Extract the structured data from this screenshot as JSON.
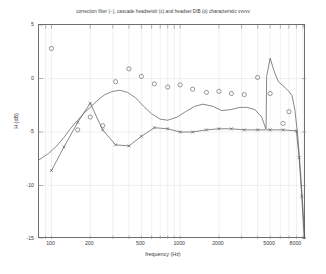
{
  "chart_data": {
    "type": "line",
    "title": "correction filter (−), cascade headsetslr (x) and headset DIB (o) characteristic  vvvvv",
    "xlabel": "frequency (Hz)",
    "ylabel": "H (dB)",
    "xscale": "log",
    "xlim": [
      80,
      9500
    ],
    "ylim": [
      -15,
      5
    ],
    "yticks": [
      5,
      0,
      -5,
      -10,
      -15
    ],
    "xticks": [
      100,
      200,
      500,
      1000,
      2000,
      5000,
      8000
    ],
    "xtick_labels": [
      "100",
      "200",
      "500",
      "1000",
      "2000",
      "5000",
      "8000"
    ],
    "grid": true,
    "legend_position": "none",
    "series": [
      {
        "name": "correction filter",
        "marker": "none",
        "line": "solid",
        "color": "#555555",
        "x": [
          80,
          95,
          110,
          125,
          140,
          160,
          180,
          200,
          230,
          260,
          300,
          340,
          390,
          450,
          520,
          600,
          700,
          800,
          950,
          1100,
          1300,
          1500,
          1800,
          2100,
          2500,
          2900,
          3300,
          3800,
          4300,
          4600,
          4650,
          4700,
          5000,
          5400,
          5800,
          6200,
          6600,
          7000,
          7400,
          7800,
          8200,
          8600,
          9000,
          9300
        ],
        "y": [
          -7.6,
          -7.0,
          -6.3,
          -5.5,
          -4.7,
          -3.9,
          -3.2,
          -2.7,
          -2.0,
          -1.5,
          -1.2,
          -1.1,
          -1.3,
          -1.8,
          -2.6,
          -3.3,
          -3.8,
          -3.9,
          -3.6,
          -3.1,
          -2.6,
          -2.4,
          -2.6,
          -3.0,
          -2.9,
          -2.7,
          -2.7,
          -2.9,
          -3.6,
          -4.6,
          -4.7,
          0.2,
          1.9,
          0.6,
          -0.3,
          -0.6,
          -0.9,
          -1.2,
          -1.6,
          -3.0,
          -5.4,
          -8.6,
          -12.2,
          -15.0
        ]
      },
      {
        "name": "cascade headsetslr",
        "marker": "x",
        "line": "solid",
        "color": "#555555",
        "x": [
          100,
          125,
          160,
          200,
          250,
          315,
          400,
          500,
          630,
          800,
          1000,
          1250,
          1600,
          2000,
          2500,
          3150,
          4000,
          5000,
          6300,
          8000,
          8400,
          8800,
          9200
        ],
        "y": [
          -8.6,
          -6.4,
          -4.1,
          -2.3,
          -4.8,
          -6.2,
          -6.3,
          -5.4,
          -4.6,
          -4.7,
          -5.0,
          -5.0,
          -4.8,
          -4.7,
          -4.7,
          -4.8,
          -4.8,
          -4.8,
          -4.8,
          -4.9,
          -7.4,
          -11.0,
          -15.0
        ]
      },
      {
        "name": "headset DIB",
        "marker": "o",
        "line": "none",
        "color": "#555555",
        "x": [
          100,
          160,
          200,
          250,
          315,
          400,
          500,
          630,
          800,
          1000,
          1250,
          1600,
          2000,
          2500,
          3150,
          4000,
          5000,
          6300,
          7000
        ],
        "y": [
          2.8,
          -4.8,
          -3.6,
          -4.4,
          -0.3,
          0.9,
          0.2,
          -0.5,
          -0.8,
          -0.6,
          -1.0,
          -1.3,
          -1.2,
          -1.4,
          -1.5,
          0.1,
          -1.4,
          -4.2,
          -3.1
        ]
      }
    ]
  }
}
